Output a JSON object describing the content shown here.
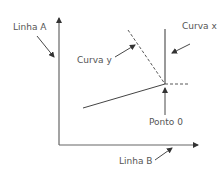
{
  "diagram": {
    "labels": {
      "linha_a": "Linha A",
      "linha_b": "Linha B",
      "curva_x": "Curva x",
      "curva_y": "Curva y",
      "ponto_0": "Ponto 0"
    },
    "colors": {
      "line": "#555555",
      "axis": "#666666",
      "text": "#555555",
      "background": "#ffffff"
    }
  }
}
